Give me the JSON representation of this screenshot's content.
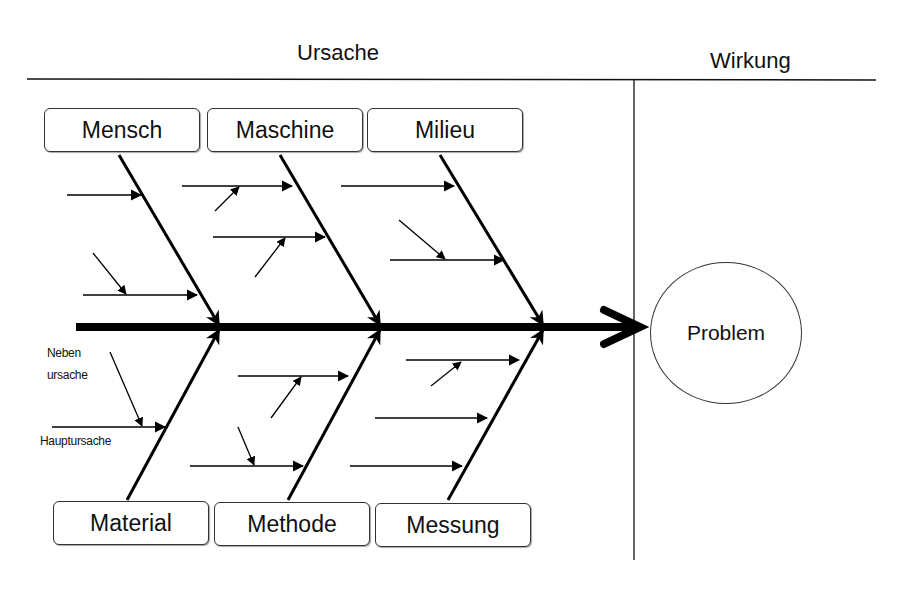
{
  "header": {
    "cause_label": "Ursache",
    "effect_label": "Wirkung"
  },
  "categories_top": [
    {
      "label": "Mensch"
    },
    {
      "label": "Maschine"
    },
    {
      "label": "Milieu"
    }
  ],
  "categories_bottom": [
    {
      "label": "Material"
    },
    {
      "label": "Methode"
    },
    {
      "label": "Messung"
    }
  ],
  "legend": {
    "secondary_cause": "Neben\nursache",
    "secondary_cause_line1": "Neben",
    "secondary_cause_line2": "ursache",
    "main_cause": "Hauptursache"
  },
  "effect": {
    "label": "Problem"
  },
  "colors": {
    "line": "#000000",
    "background": "#ffffff"
  }
}
